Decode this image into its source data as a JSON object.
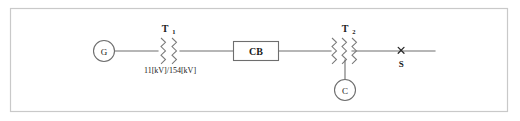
{
  "figure": {
    "kind": "single-line-diagram",
    "line_color": "#6e6e6e",
    "frame_color": "#c9c9c9",
    "background": "#ffffff"
  },
  "nodes": {
    "generator": {
      "label": "G",
      "name": "generator"
    },
    "capacitor": {
      "label": "C",
      "name": "capacitor"
    }
  },
  "devices": {
    "transformer_1": {
      "label": "T",
      "subscript": "1",
      "rating": "11[kV]/154[kV]",
      "windings": 2
    },
    "transformer_2": {
      "label": "T",
      "subscript": "2",
      "rating": "",
      "windings": 3
    },
    "circuit_breaker": {
      "label": "CB"
    }
  },
  "fault": {
    "marker": "×",
    "label": "S"
  }
}
